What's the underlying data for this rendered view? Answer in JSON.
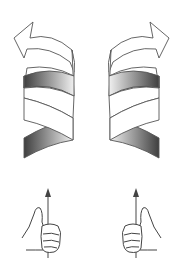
{
  "diagram": {
    "panels": [
      {
        "id": "left",
        "handedness": "left-handed helix",
        "arrow_direction": "up-left",
        "hand": "left hand, thumb up"
      },
      {
        "id": "right",
        "handedness": "right-handed helix",
        "arrow_direction": "up-right",
        "hand": "right hand, thumb up"
      }
    ],
    "colors": {
      "background": "#ffffff",
      "outline": "#555555",
      "ribbon_light": "#ffffff",
      "ribbon_shade_dark": "#4a4a4a",
      "ribbon_shade_light": "#e8e8e8",
      "axis_arrow": "#666666"
    }
  }
}
